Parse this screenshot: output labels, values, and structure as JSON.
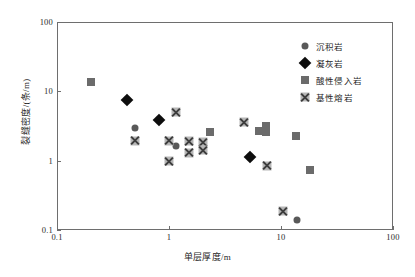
{
  "chart_data": {
    "type": "scatter",
    "title": "",
    "xlabel": "单层厚度/m",
    "ylabel": "裂缝密度/(条/m)",
    "xscale": "log",
    "yscale": "log",
    "xlim": [
      0.1,
      100
    ],
    "ylim": [
      0.1,
      100
    ],
    "xticks": [
      "0.1",
      "1",
      "10",
      "100"
    ],
    "yticks": [
      "0.1",
      "1",
      "10",
      "100"
    ],
    "grid": false,
    "legend_position": "top-right",
    "series": [
      {
        "name": "沉积岩",
        "marker": "circle",
        "color": "#595959",
        "points": [
          {
            "x": 0.5,
            "y": 3.0
          },
          {
            "x": 1.15,
            "y": 1.65
          },
          {
            "x": 14.0,
            "y": 0.14
          }
        ]
      },
      {
        "name": "凝灰岩",
        "marker": "diamond",
        "color": "#0d0d0d",
        "points": [
          {
            "x": 0.42,
            "y": 7.4
          },
          {
            "x": 0.82,
            "y": 3.8
          },
          {
            "x": 5.3,
            "y": 1.12
          }
        ]
      },
      {
        "name": "酸性侵入岩",
        "marker": "square",
        "color": "#6b6b6b",
        "points": [
          {
            "x": 0.2,
            "y": 13.5
          },
          {
            "x": 2.3,
            "y": 2.6
          },
          {
            "x": 6.4,
            "y": 2.7
          },
          {
            "x": 7.4,
            "y": 3.2
          },
          {
            "x": 7.3,
            "y": 2.55
          },
          {
            "x": 13.5,
            "y": 2.3
          },
          {
            "x": 18.0,
            "y": 0.73
          }
        ]
      },
      {
        "name": "基性熔岩",
        "marker": "x-square",
        "color": "#b7b7b7",
        "points": [
          {
            "x": 0.5,
            "y": 1.95
          },
          {
            "x": 1.0,
            "y": 1.95
          },
          {
            "x": 1.0,
            "y": 0.98
          },
          {
            "x": 1.15,
            "y": 5.0
          },
          {
            "x": 1.5,
            "y": 1.92
          },
          {
            "x": 1.5,
            "y": 1.3
          },
          {
            "x": 2.0,
            "y": 1.85
          },
          {
            "x": 2.0,
            "y": 1.42
          },
          {
            "x": 4.7,
            "y": 3.6
          },
          {
            "x": 7.5,
            "y": 0.84
          },
          {
            "x": 10.5,
            "y": 0.185
          }
        ]
      }
    ]
  },
  "axis": {
    "x_tick_labels": [
      "0.1",
      "1",
      "10",
      "100"
    ],
    "y_tick_labels": [
      "0.1",
      "1",
      "10",
      "100"
    ],
    "x_axis_title": "单层厚度/m",
    "y_axis_title": "裂缝密度/(条/m)"
  },
  "legend": {
    "items": [
      {
        "label": "沉积岩",
        "marker": "circle"
      },
      {
        "label": "凝灰岩",
        "marker": "diamond"
      },
      {
        "label": "酸性侵入岩",
        "marker": "square"
      },
      {
        "label": "基性熔岩",
        "marker": "x-square"
      }
    ]
  },
  "colors": {
    "circle": "#595959",
    "diamond": "#0d0d0d",
    "square": "#6b6b6b",
    "xsquare_fill": "#b7b7b7",
    "xsquare_stroke": "#3c3c3c",
    "frame": "#6e6e6e",
    "text": "#1f1f1f",
    "background": "#ffffff"
  }
}
